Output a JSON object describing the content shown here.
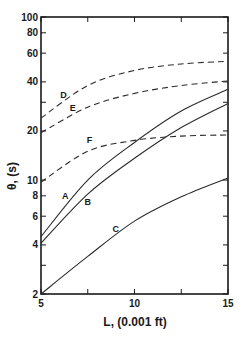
{
  "chart_data": {
    "type": "line",
    "title": "",
    "xlabel": "L, (0.001 ft)",
    "ylabel": "θ, (s)",
    "xlim": [
      5,
      15
    ],
    "ylim": [
      2,
      100
    ],
    "yscale": "log",
    "grid": false,
    "legend": "inline curve labels",
    "x_ticks": [
      5,
      10,
      15
    ],
    "x_minor_ticks": [
      7.5,
      12.5
    ],
    "y_ticks": [
      2,
      4,
      6,
      8,
      10,
      20,
      40,
      60,
      80,
      100
    ],
    "y_minor_ticks": [
      3,
      30
    ],
    "x": [
      5,
      7.5,
      10,
      12.5,
      15
    ],
    "series": [
      {
        "name": "A",
        "style": "solid",
        "values": [
          4.5,
          10.0,
          17.0,
          26.5,
          36.0
        ]
      },
      {
        "name": "B",
        "style": "solid",
        "values": [
          4.1,
          8.2,
          13.6,
          21.0,
          29.5
        ]
      },
      {
        "name": "C",
        "style": "solid",
        "values": [
          2.0,
          3.4,
          5.6,
          7.9,
          10.3
        ]
      },
      {
        "name": "D",
        "style": "dashed",
        "values": [
          24.0,
          38.0,
          47.0,
          51.5,
          53.5
        ]
      },
      {
        "name": "E",
        "style": "dashed",
        "values": [
          19.5,
          28.0,
          34.0,
          38.0,
          40.5
        ]
      },
      {
        "name": "F",
        "style": "dashed",
        "values": [
          9.7,
          15.0,
          17.5,
          18.6,
          18.9
        ]
      }
    ],
    "annotations": [
      {
        "text": "A",
        "x": 6.3,
        "y": 7.6
      },
      {
        "text": "B",
        "x": 7.5,
        "y": 7.0
      },
      {
        "text": "C",
        "x": 9.0,
        "y": 4.8
      },
      {
        "text": "D",
        "x": 6.2,
        "y": 32.0
      },
      {
        "text": "E",
        "x": 6.7,
        "y": 26.5
      },
      {
        "text": "F",
        "x": 7.6,
        "y": 16.8
      }
    ]
  }
}
